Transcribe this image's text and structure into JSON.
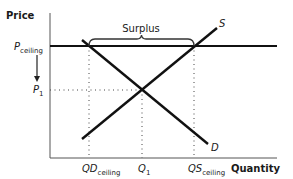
{
  "diagram": {
    "type": "supply-demand-price-ceiling",
    "axes": {
      "y_label": "Price",
      "x_label": "Quantity"
    },
    "price_labels": {
      "ceiling_main": "P",
      "ceiling_sub": "ceiling",
      "p1_main": "P",
      "p1_sub": "1"
    },
    "quantity_labels": {
      "qd_main": "QD",
      "qd_sub": "ceiling",
      "q1_main": "Q",
      "q1_sub": "1",
      "qs_main": "QS",
      "qs_sub": "ceiling"
    },
    "curves": {
      "supply_label": "S",
      "demand_label": "D"
    },
    "annotation": {
      "surplus_label": "Surplus"
    },
    "colors": {
      "line": "#111111",
      "axis": "#333333",
      "dotted": "#444444",
      "text": "#1a1a1a"
    }
  }
}
